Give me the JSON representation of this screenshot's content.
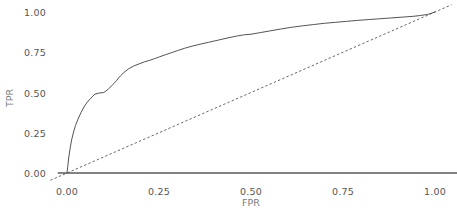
{
  "chart_data": {
    "type": "line",
    "title": "",
    "xlabel": "FPR",
    "ylabel": "TPR",
    "xlim": [
      -0.05,
      1.05
    ],
    "ylim": [
      -0.045,
      1.045
    ],
    "xticks": [
      0.0,
      0.25,
      0.5,
      0.75,
      1.0
    ],
    "yticks": [
      0.0,
      0.25,
      0.5,
      0.75,
      1.0
    ],
    "xticklabels": [
      "0.00",
      "0.25",
      "0.50",
      "0.75",
      "1.00"
    ],
    "yticklabels": [
      "0.00",
      "0.25",
      "0.50",
      "0.75",
      "1.00"
    ],
    "grid": false,
    "legend": "none",
    "series": [
      {
        "name": "ROC curve",
        "style": "solid",
        "color": "#4a4a4a",
        "linewidth": 0.9,
        "x": [
          0.0,
          0.002,
          0.005,
          0.009,
          0.013,
          0.018,
          0.023,
          0.03,
          0.038,
          0.046,
          0.055,
          0.065,
          0.076,
          0.088,
          0.1,
          0.112,
          0.124,
          0.134,
          0.14,
          0.146,
          0.155,
          0.168,
          0.182,
          0.196,
          0.21,
          0.225,
          0.24,
          0.252,
          0.268,
          0.285,
          0.3,
          0.32,
          0.34,
          0.362,
          0.385,
          0.41,
          0.435,
          0.46,
          0.48,
          0.5,
          0.525,
          0.55,
          0.58,
          0.61,
          0.64,
          0.67,
          0.7,
          0.73,
          0.76,
          0.79,
          0.82,
          0.85,
          0.88,
          0.91,
          0.94,
          0.96,
          0.98,
          0.99,
          1.0
        ],
        "y": [
          0.0,
          0.04,
          0.1,
          0.16,
          0.21,
          0.255,
          0.295,
          0.335,
          0.375,
          0.41,
          0.44,
          0.465,
          0.49,
          0.497,
          0.5,
          0.52,
          0.548,
          0.572,
          0.59,
          0.605,
          0.625,
          0.648,
          0.665,
          0.678,
          0.69,
          0.7,
          0.712,
          0.722,
          0.735,
          0.748,
          0.76,
          0.775,
          0.788,
          0.8,
          0.812,
          0.825,
          0.838,
          0.85,
          0.858,
          0.862,
          0.872,
          0.882,
          0.894,
          0.905,
          0.914,
          0.922,
          0.93,
          0.936,
          0.942,
          0.948,
          0.953,
          0.958,
          0.963,
          0.968,
          0.973,
          0.978,
          0.985,
          0.992,
          1.0
        ]
      },
      {
        "name": "chance diagonal",
        "style": "dashed",
        "color": "#555555",
        "linewidth": 0.9,
        "x": [
          -0.045,
          1.045
        ],
        "y": [
          -0.045,
          1.045
        ]
      }
    ],
    "axis_spine": {
      "position": "bottom",
      "color": "#595959",
      "linewidth": 1.6,
      "from_x": -0.025,
      "to_x": 1.06
    }
  }
}
